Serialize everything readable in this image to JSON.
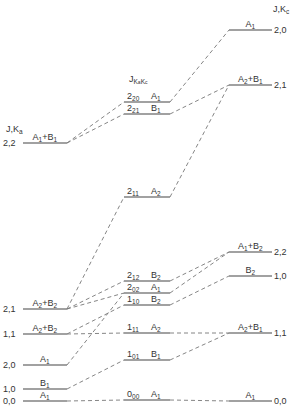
{
  "diagram": {
    "type": "correlation-energy-level-diagram",
    "left_header": "J,K_a",
    "middle_header": "J_KaKc",
    "right_header": "J,K_c",
    "left_levels": [
      {
        "id": "L22",
        "label": "2,2",
        "symmetry": "A1+B1",
        "y": 143
      },
      {
        "id": "L21",
        "label": "2,1",
        "symmetry": "A2+B2",
        "y": 309
      },
      {
        "id": "L11",
        "label": "1,1",
        "symmetry": "A2+B2",
        "y": 334
      },
      {
        "id": "L20",
        "label": "2,0",
        "symmetry": "A1",
        "y": 365
      },
      {
        "id": "L10",
        "label": "1,0",
        "symmetry": "B1",
        "y": 389
      },
      {
        "id": "L00",
        "label": "0,0",
        "symmetry": "A1",
        "y": 401
      }
    ],
    "middle_levels": [
      {
        "id": "M220",
        "J": "2",
        "sub": "20",
        "symmetry": "A1",
        "y": 102
      },
      {
        "id": "M221",
        "J": "2",
        "sub": "21",
        "symmetry": "B1",
        "y": 114
      },
      {
        "id": "M211",
        "J": "2",
        "sub": "11",
        "symmetry": "A2",
        "y": 197
      },
      {
        "id": "M212",
        "J": "2",
        "sub": "12",
        "symmetry": "B2",
        "y": 281
      },
      {
        "id": "M202",
        "J": "2",
        "sub": "02",
        "symmetry": "A1",
        "y": 293
      },
      {
        "id": "M110",
        "J": "1",
        "sub": "10",
        "symmetry": "B2",
        "y": 305
      },
      {
        "id": "M111",
        "J": "1",
        "sub": "11",
        "symmetry": "A2",
        "y": 333
      },
      {
        "id": "M101",
        "J": "1",
        "sub": "01",
        "symmetry": "B1",
        "y": 360
      },
      {
        "id": "M000",
        "J": "0",
        "sub": "00",
        "symmetry": "A1",
        "y": 400
      }
    ],
    "right_levels": [
      {
        "id": "R20",
        "label": "2,0",
        "symmetry": "A1",
        "y": 30
      },
      {
        "id": "R21",
        "label": "2,1",
        "symmetry": "A2+B1",
        "y": 85
      },
      {
        "id": "R22",
        "label": "2,2",
        "symmetry": "A1+B2",
        "y": 252
      },
      {
        "id": "R10",
        "label": "1,0",
        "symmetry": "B2",
        "y": 276
      },
      {
        "id": "R11",
        "label": "1,1",
        "symmetry": "A2+B1",
        "y": 333
      },
      {
        "id": "R00",
        "label": "0,0",
        "symmetry": "A1",
        "y": 401
      }
    ],
    "connections": [
      [
        "L22",
        "M220"
      ],
      [
        "L22",
        "M221"
      ],
      [
        "M220",
        "R20"
      ],
      [
        "M221",
        "R21"
      ],
      [
        "M211",
        "R21"
      ],
      [
        "L21",
        "M211"
      ],
      [
        "L21",
        "M212"
      ],
      [
        "L21",
        "M202"
      ],
      [
        "M212",
        "R22"
      ],
      [
        "M202",
        "R22"
      ],
      [
        "M110",
        "R10"
      ],
      [
        "L11",
        "M110"
      ],
      [
        "L11",
        "M111"
      ],
      [
        "M111",
        "R11"
      ],
      [
        "M101",
        "R11"
      ],
      [
        "L20",
        "M202"
      ],
      [
        "L10",
        "M101"
      ],
      [
        "L00",
        "M000"
      ],
      [
        "M000",
        "R00"
      ]
    ]
  }
}
